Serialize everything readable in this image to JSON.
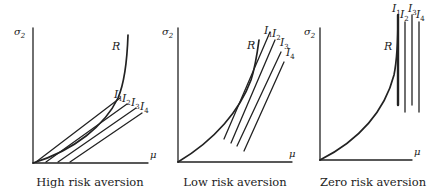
{
  "figure": {
    "panels": [
      {
        "id": "high",
        "caption": "High risk aversion",
        "y_axis_label": "σ",
        "y_axis_sub": "2",
        "x_axis_label": "μ",
        "curve_label": "R",
        "indifference_labels": [
          {
            "letter": "I",
            "sub": "1"
          },
          {
            "letter": "I",
            "sub": "2"
          },
          {
            "letter": "I",
            "sub": "3"
          },
          {
            "letter": "I",
            "sub": "4"
          }
        ]
      },
      {
        "id": "low",
        "caption": "Low risk aversion",
        "y_axis_label": "σ",
        "y_axis_sub": "2",
        "x_axis_label": "μ",
        "curve_label": "R",
        "indifference_labels": [
          {
            "letter": "I",
            "sub": "1"
          },
          {
            "letter": "I",
            "sub": "2"
          },
          {
            "letter": "I",
            "sub": "3"
          },
          {
            "letter": "I",
            "sub": "4"
          }
        ]
      },
      {
        "id": "zero",
        "caption": "Zero risk aversion",
        "y_axis_label": "σ",
        "y_axis_sub": "2",
        "x_axis_label": "μ",
        "curve_label": "R",
        "indifference_labels": [
          {
            "letter": "I",
            "sub": "1"
          },
          {
            "letter": "I",
            "sub": "2"
          },
          {
            "letter": "I",
            "sub": "3"
          },
          {
            "letter": "I",
            "sub": "4"
          }
        ]
      }
    ],
    "colors": {
      "ink": "#222222",
      "background": "#ffffff"
    }
  }
}
